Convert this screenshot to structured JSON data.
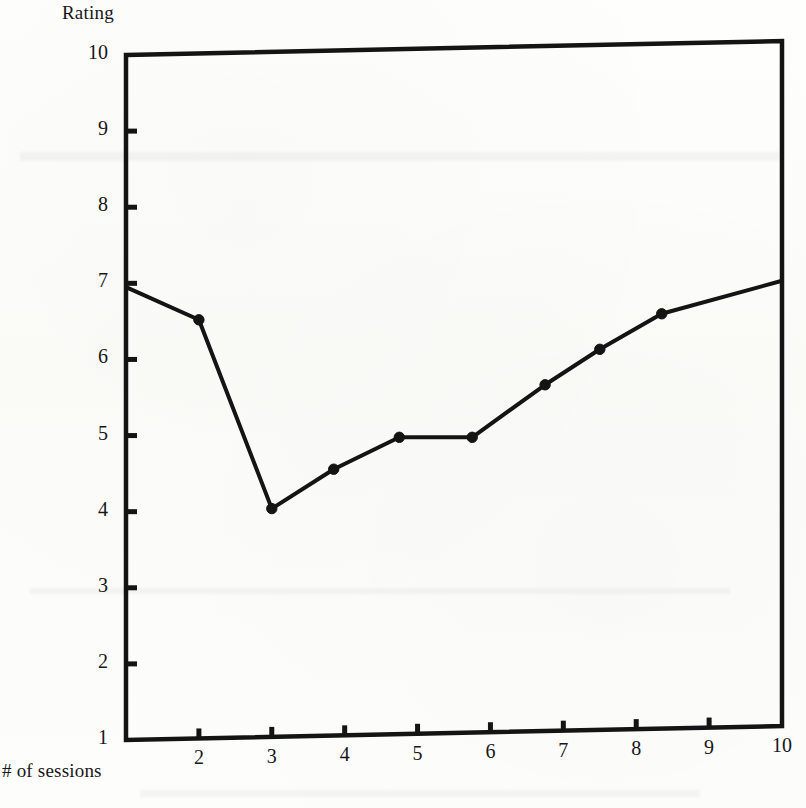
{
  "figure": {
    "background_color": "#fdfdfb",
    "ink_color": "#141414",
    "y_axis_title": "Rating",
    "x_axis_title": "# of sessions"
  },
  "chart_data": {
    "type": "line",
    "title": "",
    "subtitle": "",
    "xlabel": "# of sessions",
    "ylabel": "Rating",
    "xlim": [
      1,
      10
    ],
    "ylim": [
      1,
      10
    ],
    "grid": false,
    "legend": null,
    "legend_position": "none",
    "xticks": [
      1,
      2,
      3,
      4,
      5,
      6,
      7,
      8,
      9,
      10
    ],
    "xtick_labels": [
      "1",
      "2",
      "3",
      "4",
      "5",
      "6",
      "7",
      "8",
      "9",
      "10"
    ],
    "yticks": [
      1,
      2,
      3,
      4,
      5,
      6,
      7,
      8,
      9,
      10
    ],
    "ytick_labels": [
      "1",
      "2",
      "3",
      "4",
      "5",
      "6",
      "7",
      "8",
      "9",
      "10"
    ],
    "marker": "filled-circle",
    "line_color": "#141414",
    "line_width": 4,
    "series": [
      {
        "name": "Rating",
        "x": [
          1.0,
          2.0,
          3.0,
          3.85,
          4.75,
          5.75,
          6.75,
          7.5,
          8.35,
          10.0
        ],
        "y": [
          6.95,
          6.5,
          4.0,
          4.5,
          4.9,
          4.88,
          5.55,
          6.0,
          6.45,
          6.85
        ]
      }
    ],
    "annotations": []
  }
}
